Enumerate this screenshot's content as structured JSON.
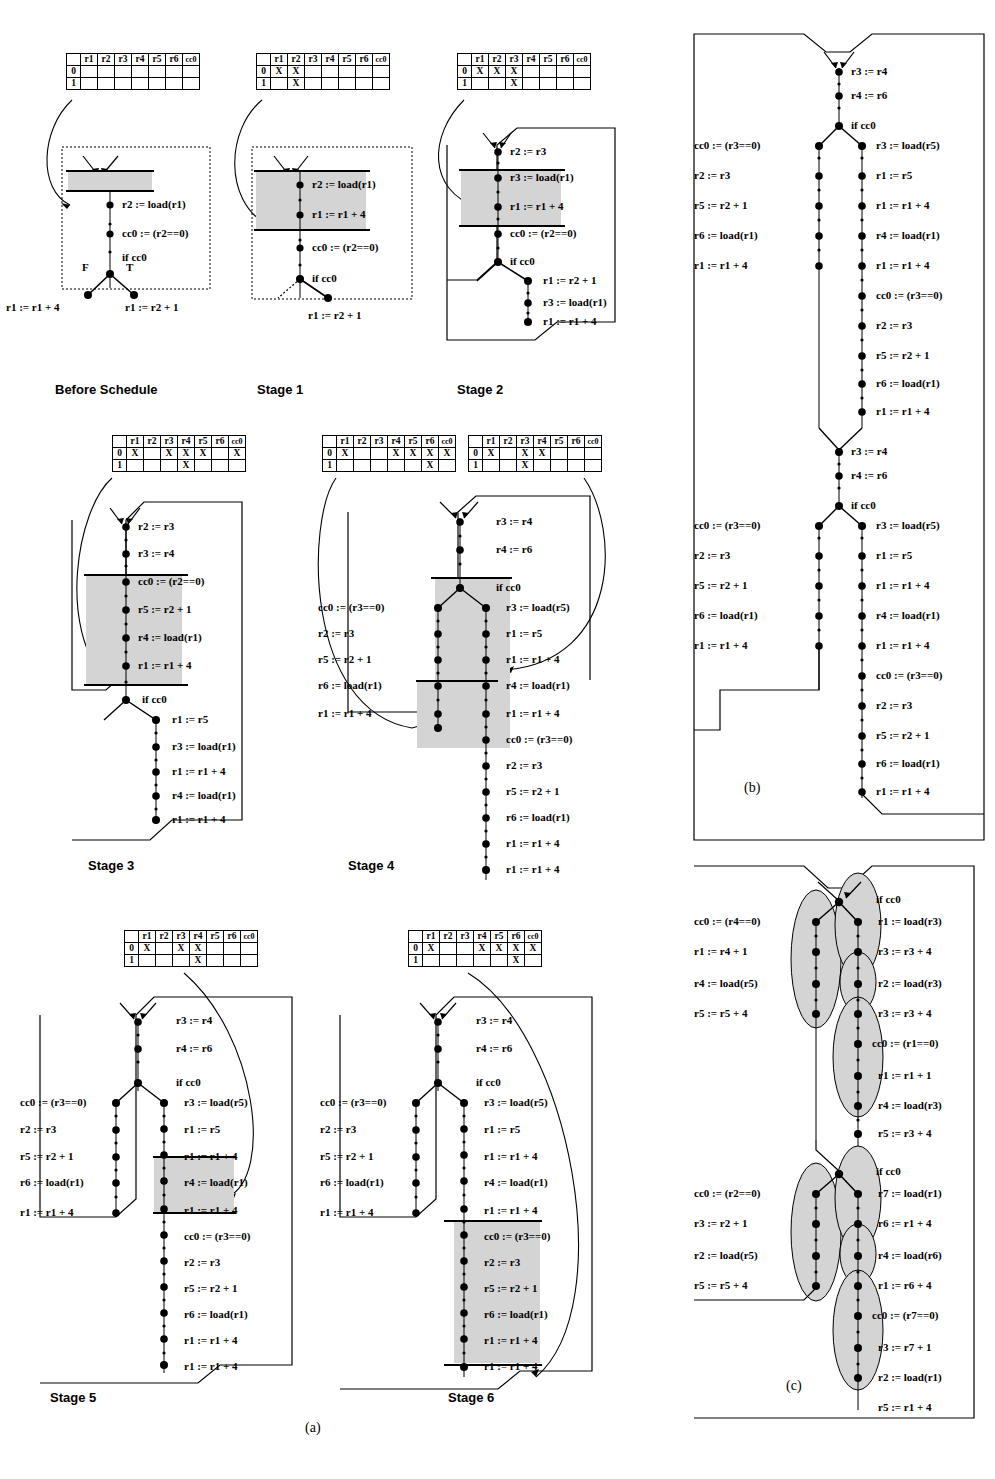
{
  "figure": {
    "panel_labels": {
      "a": "(a)",
      "b": "(b)",
      "c": "(c)"
    },
    "table_headers": [
      "",
      "r1",
      "r2",
      "r3",
      "r4",
      "r5",
      "r6",
      "cc0"
    ],
    "row_labels": [
      "0",
      "1"
    ],
    "mark": "X"
  },
  "colors": {
    "shade": "#d4d4d4",
    "line": "#000000",
    "background": "#ffffff"
  },
  "stages": [
    {
      "name": "before-schedule",
      "label": "Before Schedule",
      "table": {
        "row0": [],
        "row1": []
      },
      "branch_labels": {
        "false": "F",
        "true": "T"
      },
      "main": [
        "r2 := load(r1)",
        "cc0 := (r2==0)",
        "if cc0"
      ],
      "left_branch": [
        "r1 := r1 + 4"
      ],
      "right_branch": [
        "r1 := r2 + 1"
      ]
    },
    {
      "name": "stage-1",
      "label": "Stage  1",
      "table": {
        "row0": [
          "r1",
          "r2"
        ],
        "row1": [
          "r2"
        ]
      },
      "shaded": [
        "r2 := load(r1)",
        "r1 := r1 + 4"
      ],
      "main": [
        "r2 := load(r1)",
        "r1 := r1 + 4",
        "cc0 := (r2==0)",
        "if cc0"
      ],
      "right_branch": [
        "r1 := r2 + 1"
      ]
    },
    {
      "name": "stage-2",
      "label": "Stage  2",
      "table": {
        "row0": [
          "r1",
          "r2",
          "r3"
        ],
        "row1": [
          "r3"
        ]
      },
      "shaded": [
        "r3 := load(r1)",
        "r1 := r1 + 4"
      ],
      "main": [
        "r2 := r3",
        "r3 := load(r1)",
        "r1 := r1 + 4",
        "cc0 := (r2==0)",
        "if cc0"
      ],
      "right_branch": [
        "r1 := r2 + 1",
        "r3 := load(r1)",
        "r1 := r1 + 4"
      ]
    },
    {
      "name": "stage-3",
      "label": "Stage  3",
      "table": {
        "row0": [
          "r1",
          "r3",
          "r4",
          "r5",
          "cc0"
        ],
        "row1": [
          "r4"
        ]
      },
      "shaded": [
        "cc0 := (r2==0)",
        "r5 := r2 + 1",
        "r4 := load(r1)",
        "r1 := r1 + 4"
      ],
      "main": [
        "r2 := r3",
        "r3 := r4",
        "cc0 := (r2==0)",
        "r5 := r2 + 1",
        "r4 := load(r1)",
        "r1 := r1 + 4",
        "if cc0"
      ],
      "right_branch": [
        "r1 := r5",
        "r3 := load(r1)",
        "r1 := r1 + 4",
        "r4 := load(r1)",
        "r1 := r1 + 4"
      ]
    },
    {
      "name": "stage-4",
      "label": "Stage  4",
      "table_left": {
        "row0": [
          "r1",
          "r4",
          "r5",
          "r6",
          "cc0"
        ],
        "row1": [
          "r6"
        ]
      },
      "table_right": {
        "row0": [
          "r1",
          "r3",
          "r4"
        ],
        "row1": [
          "r3"
        ]
      },
      "head": [
        "r3 := r4",
        "r4 := r6",
        "if cc0"
      ],
      "left_branch": [
        "cc0 := (r3==0)",
        "r2 := r3",
        "r5 := r2 + 1",
        "r6 := load(r1)",
        "r1 := r1 + 4"
      ],
      "right_branch": [
        "r3 := load(r5)",
        "r1 := r5",
        "r1 := r1 + 4",
        "r4 := load(r1)",
        "r1 := r1 + 4",
        "cc0 := (r3==0)",
        "r2 := r3",
        "r5 := r2 + 1",
        "r6 := load(r1)",
        "r1 := r1 + 4"
      ]
    },
    {
      "name": "stage-5",
      "label": "Stage  5",
      "table": {
        "row0": [
          "r1",
          "r3",
          "r4"
        ],
        "row1": [
          "r4"
        ]
      },
      "shaded": [
        "r4 := load(r1)",
        "r1 := r1 + 4"
      ],
      "head": [
        "r3 := r4",
        "r4 := r6",
        "if cc0"
      ],
      "left_branch": [
        "cc0 := (r3==0)",
        "r2 := r3",
        "r5 := r2 + 1",
        "r6 := load(r1)",
        "r1 := r1 + 4"
      ],
      "right_branch": [
        "r3 := load(r5)",
        "r1 := r5",
        "r1 := r1 + 4",
        "r4 := load(r1)",
        "r1 := r1 + 4",
        "cc0 := (r3==0)",
        "r2 := r3",
        "r5 := r2 + 1",
        "r6 := load(r1)",
        "r1 := r1 + 4"
      ]
    },
    {
      "name": "stage-6",
      "label": "Stage  6",
      "table": {
        "row0": [
          "r1",
          "r4",
          "r5",
          "r6",
          "cc0"
        ],
        "row1": [
          "r6"
        ]
      },
      "shaded": [
        "cc0 := (r3==0)",
        "r2 := r3",
        "r5 := r2 + 1",
        "r6 := load(r1)",
        "r1 := r1 + 4"
      ],
      "head": [
        "r3 := r4",
        "r4 := r6",
        "if cc0"
      ],
      "left_branch": [
        "cc0 := (r3==0)",
        "r2 := r3",
        "r5 := r2 + 1",
        "r6 := load(r1)",
        "r1 := r1 + 4"
      ],
      "right_branch": [
        "r3 := load(r5)",
        "r1 := r5",
        "r1 := r1 + 4",
        "r4 := load(r1)",
        "r1 := r1 + 4",
        "cc0 := (r3==0)",
        "r2 := r3",
        "r5 := r2 + 1",
        "r6 := load(r1)",
        "r1 := r1 + 4"
      ]
    }
  ],
  "panel_b": {
    "label": "(b)",
    "blocks": [
      {
        "head": [
          "r3 := r4",
          "r4 := r6",
          "if cc0"
        ],
        "left_branch": [
          "cc0 := (r3==0)",
          "r2 := r3",
          "r5 := r2 + 1",
          "r6 := load(r1)",
          "r1 := r1 + 4"
        ],
        "right_branch": [
          "r3 := load(r5)",
          "r1 := r5",
          "r1 := r1 + 4",
          "r4 := load(r1)",
          "r1 := r1 + 4",
          "cc0 := (r3==0)",
          "r2 := r3",
          "r5 := r2 + 1",
          "r6 := load(r1)",
          "r1 := r1 + 4"
        ]
      },
      {
        "head": [
          "r3 := r4",
          "r4 := r6",
          "if cc0"
        ],
        "left_branch": [
          "cc0 := (r3==0)",
          "r2 := r3",
          "r5 := r2 + 1",
          "r6 := load(r1)",
          "r1 := r1 + 4"
        ],
        "right_branch": [
          "r3 := load(r5)",
          "r1 := r5",
          "r1 := r1 + 4",
          "r4 := load(r1)",
          "r1 := r1 + 4",
          "cc0 := (r3==0)",
          "r2 := r3",
          "r5 := r2 + 1",
          "r6 := load(r1)",
          "r1 := r1 + 4"
        ]
      }
    ]
  },
  "panel_c": {
    "label": "(c)",
    "blocks": [
      {
        "head": [
          "if cc0"
        ],
        "left_branch": [
          "cc0 := (r4==0)",
          "r1 := r4 + 1",
          "r4 := load(r5)",
          "r5 := r5 + 4"
        ],
        "right_branch": [
          "r1 := load(r3)",
          "r3 := r3 + 4",
          "r2 := load(r3)",
          "r3 := r3 + 4",
          "cc0 := (r1==0)",
          "r1 := r1 + 1",
          "r4 := load(r3)",
          "r5 := r3 + 4"
        ]
      },
      {
        "head": [
          "if cc0"
        ],
        "left_branch": [
          "cc0 := (r2==0)",
          "r3 := r2 + 1",
          "r2 := load(r5)",
          "r5 := r5 + 4"
        ],
        "right_branch": [
          "r7 := load(r1)",
          "r6 := r1 + 4",
          "r4 := load(r6)",
          "r1 := r6 + 4",
          "cc0 := (r7==0)",
          "r3 := r7 + 1",
          "r2 := load(r1)",
          "r5 := r1 + 4"
        ]
      }
    ]
  }
}
